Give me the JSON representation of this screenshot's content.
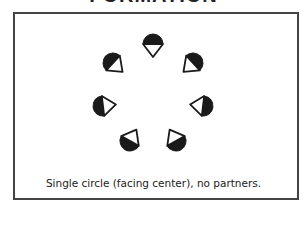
{
  "title": "FORMATION",
  "caption": "Single circle (facing center), no partners.",
  "colors": {
    "border": "#444444",
    "dancer_fill": "#1a1a1a",
    "text": "#222222"
  },
  "formation": {
    "center": [
      153,
      100
    ],
    "dancers": [
      {
        "id": 1,
        "x": 153,
        "y": 44,
        "facing": "center"
      },
      {
        "id": 2,
        "x": 193,
        "y": 63,
        "facing": "center"
      },
      {
        "id": 3,
        "x": 203,
        "y": 106,
        "facing": "center"
      },
      {
        "id": 4,
        "x": 176,
        "y": 141,
        "facing": "center"
      },
      {
        "id": 5,
        "x": 130,
        "y": 141,
        "facing": "center"
      },
      {
        "id": 6,
        "x": 103,
        "y": 106,
        "facing": "center"
      },
      {
        "id": 7,
        "x": 113,
        "y": 63,
        "facing": "center"
      }
    ]
  }
}
